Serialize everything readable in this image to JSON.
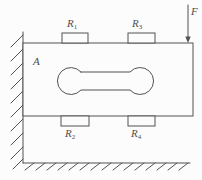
{
  "diagram": {
    "labels": {
      "plate": {
        "base": "A",
        "sub": ""
      },
      "force": {
        "base": "F",
        "sub": ""
      },
      "gauge_top_left": {
        "base": "R",
        "sub": "1"
      },
      "gauge_bottom_left": {
        "base": "R",
        "sub": "2"
      },
      "gauge_top_right": {
        "base": "R",
        "sub": "3"
      },
      "gauge_bottom_right": {
        "base": "R",
        "sub": "4"
      }
    },
    "colors": {
      "line": "#525252",
      "background": "#fcfcfc",
      "text": "#4f4f4f"
    }
  }
}
